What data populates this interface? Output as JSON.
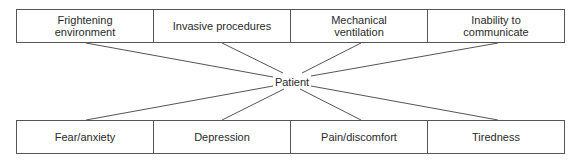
{
  "diagram": {
    "center_node": "Patient",
    "causes": [
      {
        "label": "Frightening\nenvironment"
      },
      {
        "label": "Invasive procedures"
      },
      {
        "label": "Mechanical\nventilation"
      },
      {
        "label": "Inability to\ncommunicate"
      }
    ],
    "effects": [
      {
        "label": "Fear/anxiety"
      },
      {
        "label": "Depression"
      },
      {
        "label": "Pain/discomfort"
      },
      {
        "label": "Tiredness"
      }
    ],
    "colors": {
      "line": "#555555",
      "text": "#2a2a2a",
      "background": "#ffffff"
    }
  }
}
